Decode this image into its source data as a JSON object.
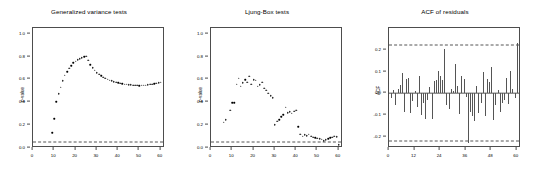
{
  "figure": {
    "background": "#ffffff",
    "axis_color": "#4d4d4d",
    "point_color": "#000000",
    "reference_line_color": "#555555"
  },
  "chart_data": [
    {
      "type": "scatter",
      "panel_index": 0,
      "title": "Generalized variance tests",
      "xlabel": "",
      "ylabel": "p-value",
      "xlim": [
        0,
        62
      ],
      "ylim": [
        0.0,
        1.05
      ],
      "grid": false,
      "legend": null,
      "xticks": [
        0,
        10,
        20,
        30,
        40,
        50,
        60
      ],
      "xtick_labels": [
        "0",
        "10",
        "20",
        "30",
        "40",
        "50",
        "60"
      ],
      "yticks": [
        0.0,
        0.2,
        0.4,
        0.6,
        0.8,
        1.0
      ],
      "ytick_labels": [
        "0.0",
        "0.2",
        "0.4",
        "0.6",
        "0.8",
        "1.0"
      ],
      "reference_lines": [
        {
          "y": 0.05,
          "style": "dashed",
          "label": "0.05 significance level"
        }
      ],
      "x": [
        9,
        10,
        11,
        12,
        13,
        14,
        15,
        16,
        17,
        18,
        19,
        20,
        21,
        22,
        23,
        24,
        25,
        26,
        27,
        28,
        29,
        30,
        31,
        32,
        33,
        34,
        35,
        36,
        37,
        38,
        39,
        40,
        41,
        42,
        43,
        44,
        45,
        46,
        47,
        48,
        49,
        50,
        51,
        52,
        53,
        54,
        55,
        56,
        57,
        58,
        59,
        60
      ],
      "values": [
        0.145,
        0.268,
        0.418,
        0.487,
        0.545,
        0.603,
        0.648,
        0.682,
        0.712,
        0.735,
        0.757,
        0.772,
        0.785,
        0.795,
        0.803,
        0.812,
        0.818,
        0.779,
        0.742,
        0.714,
        0.692,
        0.673,
        0.657,
        0.645,
        0.634,
        0.624,
        0.616,
        0.608,
        0.601,
        0.595,
        0.589,
        0.584,
        0.58,
        0.576,
        0.573,
        0.57,
        0.567,
        0.565,
        0.563,
        0.562,
        0.561,
        0.56,
        0.561,
        0.562,
        0.564,
        0.566,
        0.569,
        0.572,
        0.576,
        0.58,
        0.584,
        0.588
      ]
    },
    {
      "type": "scatter",
      "panel_index": 1,
      "title": "Ljung-Box tests",
      "xlabel": "",
      "ylabel": "p-value",
      "xlim": [
        0,
        62
      ],
      "ylim": [
        0.0,
        1.05
      ],
      "grid": false,
      "legend": null,
      "xticks": [
        0,
        10,
        20,
        30,
        40,
        50,
        60
      ],
      "xtick_labels": [
        "0",
        "10",
        "20",
        "30",
        "40",
        "50",
        "60"
      ],
      "yticks": [
        0.0,
        0.2,
        0.4,
        0.6,
        0.8,
        1.0
      ],
      "ytick_labels": [
        "0.0",
        "0.2",
        "0.4",
        "0.6",
        "0.8",
        "1.0"
      ],
      "reference_lines": [
        {
          "y": 0.05,
          "style": "dashed",
          "label": "0.05 significance level"
        }
      ],
      "x": [
        4,
        6,
        7,
        9,
        10,
        11,
        12,
        13,
        14,
        15,
        16,
        17,
        18,
        19,
        20,
        21,
        22,
        23,
        24,
        25,
        26,
        27,
        28,
        29,
        30,
        31,
        32,
        33,
        34,
        35,
        36,
        37,
        38,
        39,
        40,
        41,
        42,
        43,
        44,
        45,
        46,
        47,
        48,
        49,
        50,
        51,
        52,
        53,
        54,
        55,
        56,
        57,
        58,
        59,
        60
      ],
      "values": [
        0.012,
        0.238,
        0.262,
        0.345,
        0.408,
        0.41,
        0.572,
        0.625,
        0.552,
        0.585,
        0.61,
        0.588,
        0.642,
        0.572,
        0.612,
        0.605,
        0.555,
        0.565,
        0.588,
        0.538,
        0.52,
        0.492,
        0.47,
        0.452,
        0.215,
        0.248,
        0.262,
        0.285,
        0.302,
        0.368,
        0.322,
        0.33,
        0.318,
        0.335,
        0.342,
        0.198,
        0.135,
        0.118,
        0.128,
        0.122,
        0.132,
        0.115,
        0.108,
        0.102,
        0.098,
        0.095,
        0.088,
        0.078,
        0.085,
        0.092,
        0.102,
        0.108,
        0.118,
        0.112,
        0.042
      ]
    },
    {
      "type": "bar",
      "panel_index": 2,
      "title": "ACF of residuals",
      "xlabel": "",
      "ylabel": "ACF",
      "xlim": [
        0,
        62
      ],
      "ylim": [
        -0.25,
        0.3
      ],
      "grid": false,
      "legend": null,
      "xticks": [
        0,
        12,
        24,
        36,
        48,
        60
      ],
      "xtick_labels": [
        "0",
        "12",
        "24",
        "36",
        "48",
        "60"
      ],
      "yticks": [
        -0.2,
        -0.1,
        0.0,
        0.1,
        0.2
      ],
      "ytick_labels": [
        "-0.2",
        "-0.1",
        "0.0",
        "0.1",
        "0.2"
      ],
      "reference_lines": [
        {
          "y": 0.22,
          "style": "dashed",
          "label": "upper confidence bound"
        },
        {
          "y": 0.0,
          "style": "solid",
          "label": "zero line"
        },
        {
          "y": -0.22,
          "style": "dashed",
          "label": "lower confidence bound"
        }
      ],
      "categories": [
        1,
        2,
        3,
        4,
        5,
        6,
        7,
        8,
        9,
        10,
        11,
        12,
        13,
        14,
        15,
        16,
        17,
        18,
        19,
        20,
        21,
        22,
        23,
        24,
        25,
        26,
        27,
        28,
        29,
        30,
        31,
        32,
        33,
        34,
        35,
        36,
        37,
        38,
        39,
        40,
        41,
        42,
        43,
        44,
        45,
        46,
        47,
        48,
        49,
        50,
        51,
        52,
        53,
        54,
        55,
        56,
        57,
        58,
        59,
        60
      ],
      "values": [
        -0.02,
        0.015,
        -0.055,
        0.02,
        0.04,
        0.095,
        -0.085,
        0.065,
        0.072,
        -0.09,
        -0.035,
        0.012,
        -0.06,
        0.078,
        -0.1,
        -0.045,
        -0.115,
        -0.03,
        0.028,
        -0.115,
        0.055,
        0.06,
        0.105,
        0.08,
        0.062,
        0.205,
        -0.055,
        -0.07,
        0.022,
        0.012,
        0.135,
        0.035,
        -0.095,
        0.082,
        0.065,
        -0.018,
        -0.225,
        -0.085,
        -0.105,
        -0.125,
        0.035,
        -0.088,
        -0.045,
        0.1,
        -0.105,
        0.068,
        0.052,
        0.122,
        -0.12,
        -0.055,
        0.018,
        -0.085,
        -0.045,
        -0.03,
        0.072,
        -0.048,
        0.105,
        0.022,
        -0.02,
        0.23
      ]
    }
  ]
}
